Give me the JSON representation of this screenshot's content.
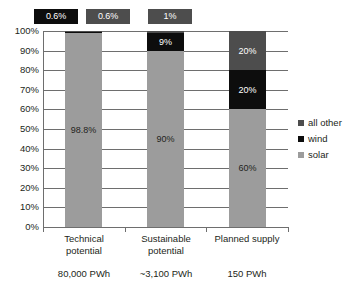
{
  "chart_data": {
    "type": "bar",
    "title": "",
    "subtitle": "",
    "xlabel": "",
    "ylabel": "",
    "stacked": true,
    "normalized_percent": true,
    "grid": true,
    "legend_position": "right",
    "ylim": [
      0,
      100
    ],
    "ytick_labels": [
      "100%",
      "90%",
      "80%",
      "70%",
      "60%",
      "50%",
      "40%",
      "30%",
      "20%",
      "10%",
      "0%"
    ],
    "ytick_values": [
      100,
      90,
      80,
      70,
      60,
      50,
      40,
      30,
      20,
      10,
      0
    ],
    "categories": [
      "Technical potential",
      "Sustainable potential",
      "Planned supply"
    ],
    "category_lines": [
      [
        "Technical",
        "potential"
      ],
      [
        "Sustainable",
        "potential"
      ],
      [
        "Planned supply",
        ""
      ]
    ],
    "category_values": [
      "80,000 PWh",
      "~3,100 PWh",
      "150 PWh"
    ],
    "series": [
      {
        "name": "solar",
        "color": "#9c9c9c",
        "values": [
          98.8,
          90,
          60
        ],
        "labels": [
          "98.8%",
          "90%",
          "60%"
        ],
        "label_colors": [
          "#231f20",
          "#231f20",
          "#231f20"
        ],
        "labels_inside": [
          true,
          true,
          true
        ]
      },
      {
        "name": "wind",
        "color": "#0d0d0d",
        "values": [
          0.6,
          9,
          20
        ],
        "labels": [
          "0.6%",
          "9%",
          "20%"
        ],
        "label_colors": [
          "#ffffff",
          "#ffffff",
          "#ffffff"
        ],
        "labels_inside": [
          false,
          true,
          true
        ]
      },
      {
        "name": "all other",
        "color": "#4d4d4d",
        "values": [
          0.6,
          1,
          20
        ],
        "labels": [
          "0.6%",
          "1%",
          "20%"
        ],
        "label_colors": [
          "#ffffff",
          "#ffffff",
          "#ffffff"
        ],
        "labels_inside": [
          false,
          false,
          true
        ]
      }
    ],
    "callouts": [
      {
        "label": "0.6%",
        "background": "#0d0d0d",
        "text_color": "#ffffff",
        "left": 34,
        "width": 44,
        "refers_to": "wind-technical-potential"
      },
      {
        "label": "0.6%",
        "background": "#4d4d4d",
        "text_color": "#ffffff",
        "left": 86,
        "width": 44,
        "refers_to": "all-other-technical-potential"
      },
      {
        "label": "1%",
        "background": "#4d4d4d",
        "text_color": "#ffffff",
        "left": 148,
        "width": 44,
        "refers_to": "all-other-sustainable-potential"
      }
    ]
  },
  "legend": {
    "items": [
      {
        "label": "all other",
        "color": "#4d4d4d"
      },
      {
        "label": "wind",
        "color": "#0d0d0d"
      },
      {
        "label": "solar",
        "color": "#9c9c9c"
      }
    ]
  },
  "colors": {
    "solar": "#9c9c9c",
    "wind": "#0d0d0d",
    "all_other": "#4d4d4d",
    "axis": "#6e6e6e",
    "text": "#231f20",
    "background": "#ffffff"
  }
}
